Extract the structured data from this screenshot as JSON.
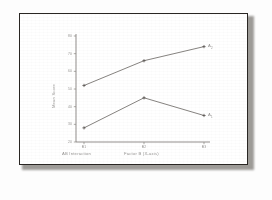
{
  "document": {
    "background_color": "#ffffff",
    "frame_color": "#2a2724"
  },
  "chart_data": {
    "type": "line",
    "title": "",
    "xlabel": "Factor B (X-axis)",
    "ylabel": "Mean Score",
    "categories": [
      "B1",
      "B2",
      "B3"
    ],
    "x_tick_labels": [
      "B1",
      "B2",
      "B3"
    ],
    "y_tick_labels": [
      "80",
      "70",
      "60",
      "50",
      "40",
      "30",
      "20"
    ],
    "ylim": [
      20,
      80
    ],
    "grid": false,
    "legend_position": "right-endpoint-labels",
    "series": [
      {
        "name": "A2",
        "label": "A₂",
        "values": [
          52,
          66,
          74
        ]
      },
      {
        "name": "A1",
        "label": "A₁",
        "values": [
          28,
          45,
          35
        ]
      }
    ],
    "annotations": {
      "left_caption": "AB Interaction",
      "right_caption": "Factor B (X-axis)"
    }
  },
  "captions": {
    "left": "AB Interaction",
    "right": "Factor B (X-axis)"
  }
}
